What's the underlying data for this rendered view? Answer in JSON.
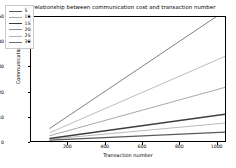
{
  "chart_data": {
    "type": "line",
    "title": "The relationship between communication cost and transaction number",
    "xlabel": "Transaction number",
    "ylabel": "Communication cost (MB)",
    "xlim": [
      0,
      1050
    ],
    "ylim": [
      0,
      50
    ],
    "xticks": [
      200,
      400,
      600,
      800,
      1000
    ],
    "yticks": [
      0,
      10,
      20,
      30,
      40,
      50
    ],
    "grid": false,
    "legend_position": "upper left",
    "legend_title": "",
    "x": [
      100,
      1000
    ],
    "series": [
      {
        "name": "5",
        "values": [
          0.35,
          3.4
        ],
        "color": "#595959",
        "width": 1.4
      },
      {
        "name": "10",
        "values": [
          0.7,
          6.9
        ],
        "color": "#a8a8a8",
        "width": 0.8
      },
      {
        "name": "15",
        "values": [
          1.05,
          10.3
        ],
        "color": "#3f3f3f",
        "width": 1.5
      },
      {
        "name": "20",
        "values": [
          2.1,
          20.6
        ],
        "color": "#8f8f8f",
        "width": 0.8
      },
      {
        "name": "25",
        "values": [
          3.3,
          32.5
        ],
        "color": "#b5b5b5",
        "width": 0.9
      },
      {
        "name": "30",
        "values": [
          5.0,
          50.0
        ],
        "color": "#6f6f6f",
        "width": 0.9
      }
    ]
  },
  "legend": {
    "items": [
      {
        "label": "5"
      },
      {
        "label": "10"
      },
      {
        "label": "15"
      },
      {
        "label": "20"
      },
      {
        "label": "25"
      },
      {
        "label": "30"
      }
    ]
  },
  "axis": {
    "xtick_labels": [
      "200",
      "400",
      "600",
      "800",
      "1000"
    ],
    "ytick_labels": [
      "0",
      "10",
      "20",
      "30",
      "40",
      "50"
    ]
  }
}
